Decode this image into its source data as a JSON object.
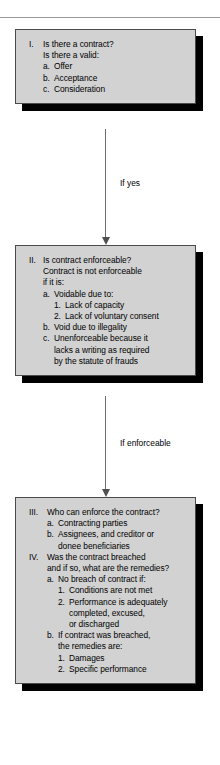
{
  "document": {
    "type": "flowchart",
    "title": "Contract Analysis Flowchart",
    "divider": "horizontal-rule"
  },
  "nodes": [
    {
      "id": "node-1",
      "name": "is-there-a-contract",
      "lines": [
        {
          "level": 0,
          "marker": "I.",
          "text": "Is there a contract?"
        },
        {
          "level": 0,
          "marker": "",
          "text": "Is there a valid:",
          "continuation": true
        },
        {
          "level": 1,
          "marker": "a.",
          "text": "Offer"
        },
        {
          "level": 1,
          "marker": "b.",
          "text": "Acceptance"
        },
        {
          "level": 1,
          "marker": "c.",
          "text": "Consideration"
        }
      ]
    },
    {
      "id": "node-2",
      "name": "is-contract-enforceable",
      "lines": [
        {
          "level": 0,
          "marker": "II.",
          "text": "Is contract enforceable?"
        },
        {
          "level": 0,
          "marker": "",
          "text": "Contract is not enforceable",
          "continuation": true
        },
        {
          "level": 0,
          "marker": "",
          "text": "if it is:",
          "continuation": true
        },
        {
          "level": 1,
          "marker": "a.",
          "text": "Voidable due to:"
        },
        {
          "level": 2,
          "marker": "1.",
          "text": "Lack of capacity"
        },
        {
          "level": 2,
          "marker": "2.",
          "text": "Lack of voluntary consent"
        },
        {
          "level": 1,
          "marker": "b.",
          "text": "Void due to illegality"
        },
        {
          "level": 1,
          "marker": "c.",
          "text": "Unenforceable because it"
        },
        {
          "level": 1,
          "marker": "",
          "text": "lacks a writing as required",
          "continuation": true
        },
        {
          "level": 1,
          "marker": "",
          "text": "by the statute of frauds",
          "continuation": true
        }
      ]
    },
    {
      "id": "node-3",
      "name": "who-can-enforce-and-breach",
      "lines": [
        {
          "level": 0,
          "marker": "III.",
          "text": "Who can enforce the contract?"
        },
        {
          "level": 1,
          "marker": "a.",
          "text": "Contracting parties"
        },
        {
          "level": 1,
          "marker": "b.",
          "text": "Assignees, and creditor or"
        },
        {
          "level": 1,
          "marker": "",
          "text": "donee beneficiaries",
          "continuation": true
        },
        {
          "level": 0,
          "marker": "IV.",
          "text": "Was the contract breached"
        },
        {
          "level": 0,
          "marker": "",
          "text": "and if so, what are the remedies?",
          "continuation": true
        },
        {
          "level": 1,
          "marker": "a.",
          "text": "No breach of contract if:"
        },
        {
          "level": 2,
          "marker": "1.",
          "text": "Conditions are not met"
        },
        {
          "level": 2,
          "marker": "2.",
          "text": "Performance is adequately"
        },
        {
          "level": 2,
          "marker": "",
          "text": "completed, excused,",
          "continuation": true
        },
        {
          "level": 2,
          "marker": "",
          "text": "or discharged",
          "continuation": true
        },
        {
          "level": 1,
          "marker": "b.",
          "text": "If contract was breached,"
        },
        {
          "level": 1,
          "marker": "",
          "text": "the remedies are:",
          "continuation": true
        },
        {
          "level": 2,
          "marker": "1.",
          "text": "Damages"
        },
        {
          "level": 2,
          "marker": "2.",
          "text": "Specific performance"
        }
      ]
    }
  ],
  "connectors": [
    {
      "id": "connector-1",
      "name": "connector-yes",
      "label": "If yes"
    },
    {
      "id": "connector-2",
      "name": "connector-enforceable",
      "label": "If enforceable"
    }
  ],
  "colors": {
    "box_fill": "#d2d2d2",
    "box_border": "#4a4a4a",
    "shadow": "#000000",
    "text": "#000000",
    "connector_line": "#6e6e6e",
    "rule": "#9a9a9a",
    "page_background": "#ffffff"
  }
}
